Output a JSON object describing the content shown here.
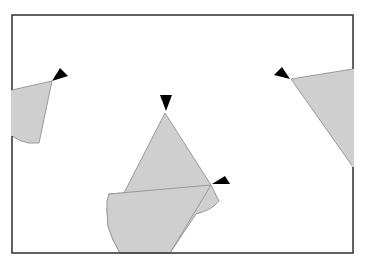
{
  "diagram": {
    "type": "agent-visibility-diagram",
    "canvas": {
      "width": 365,
      "height": 264
    },
    "frame": {
      "x": 12,
      "y": 15,
      "width": 341,
      "height": 238,
      "color": "#3a3a3a"
    },
    "colors": {
      "fov_fill": "#cfcfcf",
      "fov_stroke": "#9a9a9a",
      "agent_fill": "#000000",
      "background": "#ffffff"
    },
    "agents": [
      {
        "id": "agent-left",
        "heading": "up-right",
        "marker": "52,81 60,68 68,76",
        "fov_polygon": "M12,90 L52,81 L39,143 L29,143 Q20,142 12,136 Z"
      },
      {
        "id": "agent-center-top",
        "heading": "down",
        "marker": "160,95 172,95 166,111",
        "fov_polygon": "M165,113 L211,185 L219,201 Q212,210 196,214 L170,253 L120,253 Q112,240 108,226 L107,210 L109,194 L124,193 Z"
      },
      {
        "id": "agent-center-right",
        "heading": "left",
        "marker": "212,184 225,176 230,184",
        "fov_polygon": "M211,185 L109,194 Q106,200 107,210 L108,226 Q112,240 120,253 L170,253 Z"
      },
      {
        "id": "agent-right",
        "heading": "left",
        "marker": "274,75 282,67 290,79",
        "fov_polygon": "M291,79 L353,69 L353,167 Z"
      }
    ]
  }
}
